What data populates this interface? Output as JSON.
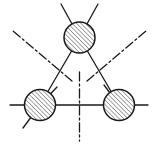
{
  "figure": {
    "type": "symmetry-diagram",
    "title": "",
    "canvas": {
      "width": 157,
      "height": 148,
      "background": "#ffffff"
    },
    "style": {
      "stroke_color": "#1a1a1a",
      "hatch_color": "#2b2b2b",
      "circle_fill": "#ffffff",
      "bond_width": 1.3,
      "circle_width": 1.5,
      "axis_width": 1.3,
      "hatch_width": 0.85,
      "hatch_spacing": 3.1,
      "hatch_angle_deg": 45,
      "axis_dash_pattern": "9 3 2 3"
    },
    "nodes": [
      {
        "name": "top-atom",
        "label": "",
        "cx": 79.5,
        "cy": 37.5,
        "r": 15.5,
        "hatched": true
      },
      {
        "name": "bottom-left-atom",
        "label": "",
        "cx": 40.0,
        "cy": 105.0,
        "r": 15.5,
        "hatched": true
      },
      {
        "name": "bottom-right-atom",
        "label": "",
        "cx": 119.0,
        "cy": 105.0,
        "r": 15.5,
        "hatched": true
      }
    ],
    "bonds": [
      {
        "name": "bond-top-to-bottom-left",
        "x1": 79.5,
        "y1": 37.5,
        "x2": 40.0,
        "y2": 105.0
      },
      {
        "name": "bond-top-to-bottom-right",
        "x1": 79.5,
        "y1": 37.5,
        "x2": 119.0,
        "y2": 105.0
      },
      {
        "name": "bond-horizontal-baseline",
        "x1": 10.0,
        "y1": 105.0,
        "x2": 148.0,
        "y2": 105.0
      }
    ],
    "stubs": [
      {
        "name": "stub-top-left",
        "x1": 79.5,
        "y1": 37.5,
        "x2": 61.0,
        "y2": 4.0
      },
      {
        "name": "stub-top-right",
        "x1": 79.5,
        "y1": 37.5,
        "x2": 98.0,
        "y2": 4.0
      },
      {
        "name": "stub-bottom-left-upper",
        "x1": 40.0,
        "y1": 105.0,
        "x2": 57.0,
        "y2": 87.0
      },
      {
        "name": "stub-bottom-left-lower",
        "x1": 40.0,
        "y1": 105.0,
        "x2": 23.0,
        "y2": 128.0
      },
      {
        "name": "stub-bottom-right-upper",
        "x1": 119.0,
        "y1": 105.0,
        "x2": 104.0,
        "y2": 85.0
      }
    ],
    "axes": [
      {
        "name": "mirror-axis-upper-left",
        "x1": 72.0,
        "y1": 81.0,
        "x2": 12.0,
        "y2": 30.0,
        "style": "dash-dot"
      },
      {
        "name": "mirror-axis-upper-right",
        "x1": 87.0,
        "y1": 81.0,
        "x2": 147.0,
        "y2": 30.0,
        "style": "dash-dot"
      },
      {
        "name": "mirror-axis-vertical",
        "x1": 79.5,
        "y1": 72.0,
        "x2": 79.5,
        "y2": 141.0,
        "style": "dash-dot"
      }
    ],
    "center_vertex": {
      "name": "symmetry-center",
      "x": 79.5,
      "y": 72.0
    },
    "legend": [],
    "annotations": []
  }
}
